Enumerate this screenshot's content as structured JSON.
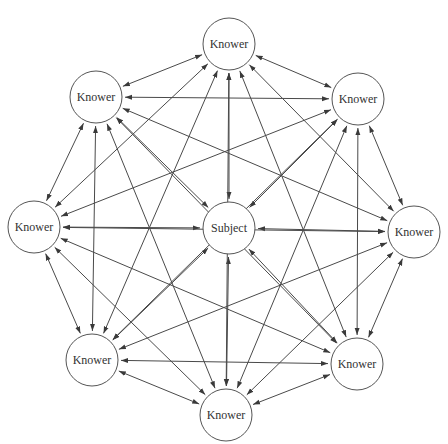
{
  "diagram": {
    "type": "complete-graph",
    "edge_style": "bidirectional-arrow",
    "colors": {
      "line": "#4a4a4a",
      "node_stroke": "#555555",
      "text": "#333333",
      "background": "#ffffff"
    },
    "node_radius": 26,
    "nodes": [
      {
        "id": "subject",
        "label": "Subject",
        "x": 229,
        "y": 228
      },
      {
        "id": "knower-top",
        "label": "Knower",
        "x": 229,
        "y": 44
      },
      {
        "id": "knower-top-right",
        "label": "Knower",
        "x": 358,
        "y": 99
      },
      {
        "id": "knower-right",
        "label": "Knower",
        "x": 414,
        "y": 232
      },
      {
        "id": "knower-bottom-right",
        "label": "Knower",
        "x": 357,
        "y": 364
      },
      {
        "id": "knower-bottom",
        "label": "Knower",
        "x": 226,
        "y": 415
      },
      {
        "id": "knower-bottom-left",
        "label": "Knower",
        "x": 92,
        "y": 360
      },
      {
        "id": "knower-left",
        "label": "Knower",
        "x": 34,
        "y": 227
      },
      {
        "id": "knower-top-left",
        "label": "Knower",
        "x": 96,
        "y": 97
      }
    ]
  }
}
